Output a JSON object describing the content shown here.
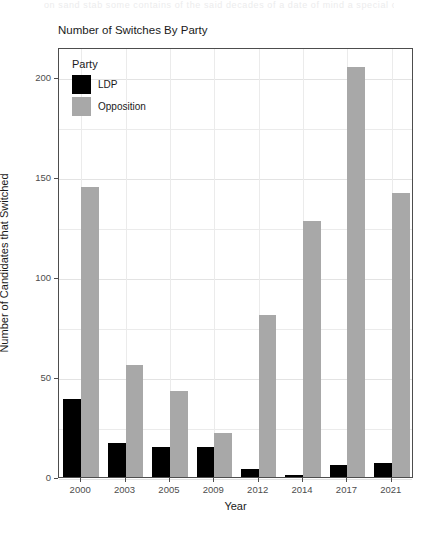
{
  "top_artifact_text": "on sand stab some contains of the said decades of a date of mind a special cause",
  "chart_data": {
    "type": "bar",
    "title": "Number of Switches By Party",
    "xlabel": "Year",
    "ylabel": "Number of Candidates that Switched",
    "categories": [
      "2000",
      "2003",
      "2005",
      "2009",
      "2012",
      "2014",
      "2017",
      "2021"
    ],
    "series": [
      {
        "name": "LDP",
        "color": "#000000",
        "values": [
          39,
          17,
          15,
          15,
          4,
          1,
          6,
          7
        ]
      },
      {
        "name": "Opposition",
        "color": "#a8a8a8",
        "values": [
          145,
          56,
          43,
          22,
          81,
          128,
          205,
          142
        ]
      }
    ],
    "ylim": [
      0,
      215
    ],
    "yticks": [
      0,
      50,
      100,
      150,
      200
    ],
    "ytick_labels": [
      "0",
      "50",
      "100",
      "150",
      "200"
    ],
    "grid": true,
    "legend_position": "top-left-inside",
    "legend_title": "Party"
  }
}
